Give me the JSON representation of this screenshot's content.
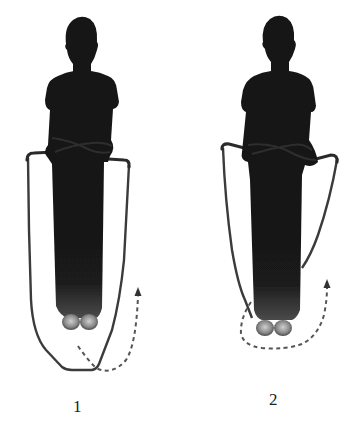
{
  "illustration": {
    "description": "Two-step jump rope instruction diagram with silhouetted figure",
    "background_color": "#ffffff",
    "silhouette_color": "#141414",
    "rope_color": "#3a3a3a",
    "arrow_color": "#555555",
    "figures": [
      {
        "step": "1",
        "label": "1",
        "rope_position": "rope low behind feet, swinging forward",
        "arrow": "dashed-curve-up-right-icon"
      },
      {
        "step": "2",
        "label": "2",
        "rope_position": "rope passing under feet",
        "arrow": "dashed-loop-under-feet-icon"
      }
    ]
  }
}
